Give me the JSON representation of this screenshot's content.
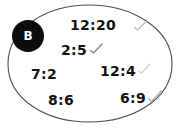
{
  "diagram": {
    "type": "venn-set-bubble",
    "background_color": "#ffffff",
    "set": {
      "label": "B",
      "badge_fill": "#0d0d0d",
      "badge_text_color": "#ffffff",
      "outline_color": "#4d4d4d",
      "outline_style": "hand-drawn ellipse"
    },
    "mark_color": "#b5b5b5",
    "items": [
      {
        "text": "12:20",
        "mark": "check-mark",
        "x": 70,
        "y": 18
      },
      {
        "text": "2:5",
        "mark": "check-mark",
        "x": 61,
        "y": 43
      },
      {
        "text": "7:2",
        "mark": "none",
        "x": 31,
        "y": 67
      },
      {
        "text": "12:4",
        "mark": "check-mark",
        "x": 100,
        "y": 64
      },
      {
        "text": "8:6",
        "mark": "none",
        "x": 48,
        "y": 93
      },
      {
        "text": "6:9",
        "mark": "check-mark",
        "x": 120,
        "y": 91
      }
    ]
  }
}
